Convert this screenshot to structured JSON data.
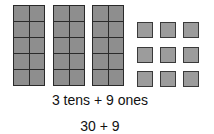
{
  "figure": {
    "tens_count": 3,
    "ones_count": 9,
    "cells_per_rod": 10,
    "colors": {
      "rod_cell_fill": "#8e8e8e",
      "rod_border": "#2a2a2a",
      "ones_fill": "#9c9c9c",
      "ones_border": "#3a3a3a"
    }
  },
  "captions": {
    "expanded_words": "3 tens + 9 ones",
    "expanded_number": "30 + 9"
  }
}
